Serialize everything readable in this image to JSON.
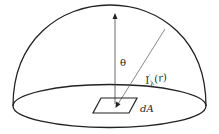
{
  "diagram": {
    "labels": {
      "theta": "θ",
      "radiance_main": "I",
      "radiance_sub": "λ",
      "radiance_sup": "′",
      "radiance_arg": "(r)",
      "area": "dA"
    },
    "colors": {
      "stroke": "#222222",
      "thin_line": "#555555",
      "background": "#ffffff"
    }
  }
}
